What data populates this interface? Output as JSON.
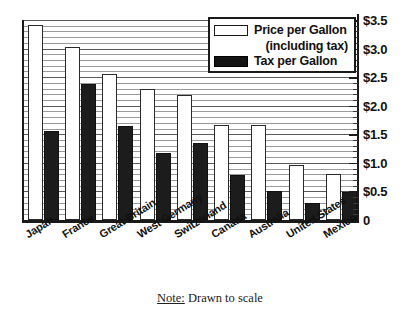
{
  "chart_data": {
    "type": "bar",
    "title": "",
    "subtitle": "",
    "xlabel": "",
    "ylabel": "",
    "ylim": [
      0,
      3.5
    ],
    "grid": true,
    "grid_minor_step": 0.1,
    "grid_major_step": 0.5,
    "legend_position": "top-right",
    "categories": [
      "Japan",
      "France",
      "Great Britain",
      "West Germany",
      "Switzerland",
      "Canada",
      "Australia",
      "United States",
      "Mexico"
    ],
    "series": [
      {
        "name": "Price per Gallon (including tax)",
        "style": "white-filled-black-outline",
        "color": "#ffffff",
        "values": [
          3.41,
          3.03,
          2.56,
          2.29,
          2.19,
          1.67,
          1.67,
          0.97,
          0.81
        ]
      },
      {
        "name": "Tax per Gallon",
        "style": "solid-black",
        "color": "#1c1c1c",
        "values": [
          1.56,
          2.38,
          1.64,
          1.18,
          1.34,
          0.79,
          0.5,
          0.3,
          0.49
        ]
      }
    ],
    "yticks": [
      0,
      0.5,
      1.0,
      1.5,
      2.0,
      2.5,
      3.0,
      3.5
    ],
    "ytick_labels": [
      "0",
      "$0.5",
      "$1.0",
      "$1.5",
      "$2.0",
      "$2.5",
      "$3.0",
      "$3.5"
    ]
  },
  "legend": {
    "entries": [
      {
        "label_line1": "Price per Gallon",
        "label_line2": "(including tax)",
        "swatch": "price"
      },
      {
        "label_line1": "Tax per Gallon",
        "label_line2": "",
        "swatch": "tax"
      }
    ]
  },
  "note": {
    "underlined": "Note:",
    "text": " Drawn to scale"
  },
  "colors": {
    "price_bar": "#ffffff",
    "price_bar_outline": "#2a2a2a",
    "tax_bar": "#1c1c1c",
    "axis": "#1a1a1a",
    "gridline": "#9a9a9a",
    "text": "#111111",
    "background": "#ffffff"
  }
}
